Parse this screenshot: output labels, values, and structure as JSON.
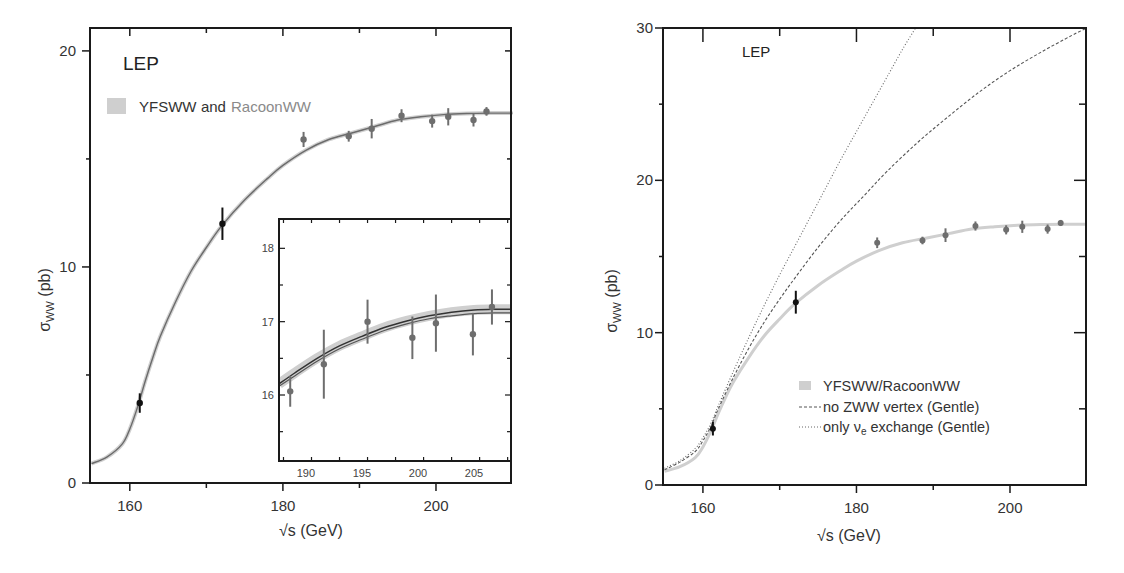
{
  "chart_data": [
    {
      "type": "line",
      "title": "",
      "annotation": "LEP",
      "xlabel": "√s (GeV)",
      "ylabel": "σWW (pb)",
      "xlim": [
        155,
        210
      ],
      "ylim": [
        0,
        21
      ],
      "xticks": [
        160,
        180,
        200
      ],
      "yticks": [
        0,
        10,
        20
      ],
      "grid": false,
      "legend": {
        "position": "upper-left",
        "entries": [
          {
            "label_part1": "YFSWW",
            "label_part2": " and ",
            "label_part3": "RacoonWW",
            "style": "band"
          }
        ]
      },
      "series": [
        {
          "name": "YFSWW and RacoonWW",
          "kind": "curve",
          "x": [
            155,
            157,
            159,
            160,
            161,
            162,
            163,
            164,
            166,
            168,
            170,
            172,
            175,
            178,
            180,
            183,
            186,
            189,
            192,
            195,
            198,
            201,
            204,
            207,
            210
          ],
          "y": [
            0.9,
            1.2,
            1.8,
            2.5,
            3.5,
            4.7,
            5.8,
            6.8,
            8.4,
            9.8,
            10.9,
            11.9,
            13.1,
            14.1,
            14.7,
            15.4,
            15.9,
            16.2,
            16.5,
            16.8,
            16.95,
            17.05,
            17.1,
            17.12,
            17.12
          ]
        },
        {
          "name": "LEP data",
          "kind": "points",
          "x": [
            161.3,
            172.1,
            182.7,
            188.6,
            191.6,
            195.5,
            199.5,
            201.6,
            204.9,
            206.6
          ],
          "y": [
            3.7,
            12.0,
            15.9,
            16.05,
            16.4,
            17.0,
            16.75,
            16.95,
            16.8,
            17.2
          ],
          "yerr": [
            0.45,
            0.75,
            0.35,
            0.25,
            0.45,
            0.3,
            0.3,
            0.4,
            0.3,
            0.2
          ]
        }
      ],
      "inset": {
        "xlim": [
          187.6,
          208.3
        ],
        "ylim": [
          15.1,
          18.4
        ],
        "xticks": [
          190,
          195,
          200,
          205
        ],
        "yticks": [
          16,
          17,
          18
        ],
        "series": [
          {
            "name": "YFSWW band",
            "kind": "curve",
            "x": [
              187.6,
              189,
              191,
              193,
              195,
              197,
              199,
              201,
              203,
              205,
              207,
              208.3
            ],
            "y": [
              16.15,
              16.3,
              16.5,
              16.67,
              16.8,
              16.92,
              17.01,
              17.08,
              17.13,
              17.16,
              17.17,
              17.17
            ]
          },
          {
            "name": "RacoonWW band",
            "kind": "curve",
            "x": [
              187.6,
              189,
              191,
              193,
              195,
              197,
              199,
              201,
              203,
              205,
              207,
              208.3
            ],
            "y": [
              16.12,
              16.26,
              16.46,
              16.63,
              16.76,
              16.88,
              16.97,
              17.04,
              17.08,
              17.11,
              17.12,
              17.12
            ]
          },
          {
            "name": "LEP data",
            "kind": "points",
            "x": [
              188.6,
              191.6,
              195.5,
              199.5,
              201.6,
              204.9,
              206.6
            ],
            "y": [
              16.05,
              16.42,
              17.0,
              16.78,
              16.98,
              16.83,
              17.2
            ],
            "yerr": [
              0.21,
              0.47,
              0.3,
              0.29,
              0.39,
              0.29,
              0.24
            ]
          }
        ]
      }
    },
    {
      "type": "line",
      "title": "",
      "annotation": "LEP",
      "xlabel": "√s (GeV)",
      "ylabel": "σWW (pb)",
      "xlim": [
        155,
        210
      ],
      "ylim": [
        0,
        30
      ],
      "xticks": [
        160,
        180,
        200
      ],
      "yticks": [
        0,
        10,
        20,
        30
      ],
      "grid": false,
      "legend": {
        "position": "lower-right",
        "entries": [
          {
            "label": "YFSWW/RacoonWW",
            "style": "band"
          },
          {
            "label": "no ZWW vertex (Gentle)",
            "style": "dashed"
          },
          {
            "label_main": "only ν",
            "label_sub": "e",
            "label_tail": " exchange (Gentle)",
            "style": "dotted"
          }
        ]
      },
      "series": [
        {
          "name": "YFSWW/RacoonWW",
          "kind": "curve",
          "x": [
            155,
            157,
            159,
            160,
            161,
            162,
            163,
            164,
            166,
            168,
            170,
            172,
            175,
            178,
            180,
            183,
            186,
            189,
            192,
            195,
            198,
            201,
            204,
            207,
            210
          ],
          "y": [
            0.9,
            1.2,
            1.8,
            2.5,
            3.5,
            4.7,
            5.8,
            6.8,
            8.4,
            9.8,
            10.9,
            11.9,
            13.1,
            14.1,
            14.7,
            15.4,
            15.9,
            16.2,
            16.5,
            16.8,
            16.95,
            17.05,
            17.1,
            17.12,
            17.12
          ]
        },
        {
          "name": "no ZWW vertex (Gentle)",
          "kind": "curve",
          "x": [
            155,
            157,
            159,
            160,
            161,
            162,
            164,
            166,
            168,
            170,
            172,
            175,
            178,
            181,
            184,
            188,
            192,
            196,
            200,
            204,
            208,
            210
          ],
          "y": [
            1.0,
            1.5,
            2.2,
            2.9,
            3.8,
            5.0,
            7.1,
            9.0,
            10.7,
            12.2,
            13.6,
            15.6,
            17.4,
            19.0,
            20.6,
            22.5,
            24.2,
            25.8,
            27.2,
            28.4,
            29.5,
            30.0
          ]
        },
        {
          "name": "only νe exchange (Gentle)",
          "kind": "curve",
          "x": [
            155,
            157,
            159,
            160,
            161,
            162,
            164,
            166,
            168,
            170,
            172,
            174,
            176,
            178,
            180,
            182,
            184,
            186,
            187.7
          ],
          "y": [
            1.1,
            1.6,
            2.4,
            3.1,
            4.0,
            5.2,
            7.5,
            9.7,
            11.8,
            13.8,
            15.7,
            17.6,
            19.5,
            21.4,
            23.2,
            25.0,
            26.8,
            28.6,
            30.0
          ]
        },
        {
          "name": "LEP data",
          "kind": "points",
          "x": [
            161.3,
            172.1,
            182.7,
            188.6,
            191.6,
            195.5,
            199.5,
            201.6,
            204.9,
            206.6
          ],
          "y": [
            3.7,
            12.0,
            15.9,
            16.05,
            16.4,
            17.0,
            16.75,
            16.95,
            16.8,
            17.2
          ],
          "yerr": [
            0.45,
            0.75,
            0.35,
            0.25,
            0.45,
            0.3,
            0.3,
            0.4,
            0.3,
            0.2
          ]
        }
      ]
    }
  ],
  "left": {
    "annotation": "LEP",
    "legend_part1": "YFSWW",
    "legend_part2": "and",
    "legend_part3": "RacoonWW",
    "ylabel_main": "σ",
    "ylabel_sub": "WW",
    "ylabel_tail": " (pb)",
    "xlabel": "√s (GeV)",
    "xtick_labels": [
      "160",
      "180",
      "200"
    ],
    "ytick_labels": [
      "0",
      "10",
      "20"
    ],
    "inset_xtick_labels": [
      "190",
      "195",
      "200",
      "205"
    ],
    "inset_ytick_labels": [
      "16",
      "17",
      "18"
    ]
  },
  "right": {
    "annotation": "LEP",
    "legend": [
      "YFSWW/RacoonWW",
      "no ZWW vertex (Gentle)"
    ],
    "legend3_main": "only ν",
    "legend3_sub": "e",
    "legend3_tail": " exchange (Gentle)",
    "ylabel_main": "σ",
    "ylabel_sub": "WW",
    "ylabel_tail": " (pb)",
    "xlabel": "√s (GeV)",
    "xtick_labels": [
      "160",
      "180",
      "200"
    ],
    "ytick_labels": [
      "0",
      "10",
      "20",
      "30"
    ]
  },
  "colors": {
    "axis": "#1a1a1a",
    "curve_left": "#6b6b6b",
    "band": "#c8c8c8",
    "data_black": "#111111",
    "data_gray": "#6e6e6e",
    "racoon_text": "#8a8a8a",
    "dashed": "#555555",
    "dotted": "#666666"
  }
}
